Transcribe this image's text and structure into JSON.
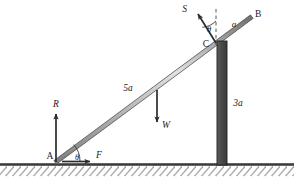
{
  "figure": {
    "type": "free-body-diagram",
    "background_color": "#ffffff"
  },
  "colors": {
    "rod": "#8c8c8c",
    "rod_edge": "#5a5a5a",
    "pillar_fill": "#4d4d4d",
    "pillar_edge": "#262626",
    "ground_line": "#3d3d3d",
    "hatch": "#a8a8a8",
    "arrow": "#2b2b2b",
    "dashed": "#555555",
    "text": "#1a1a1a"
  },
  "points": {
    "a": {
      "label": "A",
      "x": 56,
      "y": 161
    },
    "b": {
      "label": "B",
      "x": 252,
      "y": 14
    },
    "c": {
      "label": "C",
      "x": 216,
      "y": 43
    }
  },
  "forces": [
    {
      "name": "reaction-at-a",
      "label": "R",
      "direction": "up",
      "tail_x": 56,
      "tail_y": 161,
      "head_x": 56,
      "head_y": 112,
      "label_x": 56,
      "label_y": 105
    },
    {
      "name": "friction-at-a",
      "label": "F",
      "direction": "right",
      "tail_x": 62,
      "tail_y": 161,
      "head_x": 93,
      "head_y": 161,
      "label_x": 97,
      "label_y": 156
    },
    {
      "name": "weight",
      "label": "W",
      "direction": "down",
      "tail_x": 157,
      "tail_y": 90,
      "head_x": 157,
      "head_y": 125,
      "label_x": 163,
      "label_y": 127
    },
    {
      "name": "support-reaction-at-c",
      "label": "S",
      "direction": "up-left",
      "tail_x": 216,
      "tail_y": 43,
      "head_x": 196,
      "head_y": 12,
      "label_x": 190,
      "label_y": 10
    }
  ],
  "angles": [
    {
      "name": "theta-at-a",
      "label": "θ",
      "vertex_x": 56,
      "vertex_y": 161,
      "label_x": 76,
      "label_y": 158,
      "radius": 22
    },
    {
      "name": "theta-at-c",
      "label": "θ",
      "vertex_x": 216,
      "vertex_y": 43,
      "label_x": 209,
      "label_y": 31,
      "radius": 22
    }
  ],
  "dimensions": [
    {
      "name": "rod-length-a-to-w",
      "label": "5a",
      "x": 128,
      "y": 89
    },
    {
      "name": "segment-c-to-b",
      "label": "a",
      "x": 235,
      "y": 24
    },
    {
      "name": "pillar-height",
      "label": "3a",
      "x": 237,
      "y": 104
    }
  ],
  "rod": {
    "name": "ladder-rod",
    "start_x": 56,
    "start_y": 162,
    "end_x": 252,
    "end_y": 17,
    "thickness": 4
  },
  "pillar": {
    "name": "support-pillar",
    "x": 217,
    "y": 41,
    "width": 10,
    "height": 124
  },
  "ground": {
    "name": "ground-surface",
    "line_y": 165,
    "line_x1": 0,
    "line_x2": 294,
    "hatch_height": 11,
    "hatch_spacing": 7
  },
  "dashed_guide": {
    "name": "vertical-reference-line",
    "x": 216,
    "y1": 9,
    "y2": 45
  }
}
